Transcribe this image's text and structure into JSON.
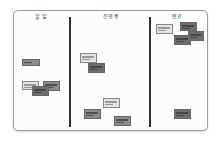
{
  "board": {
    "columns": [
      {
        "id": "todo",
        "header": "할 일"
      },
      {
        "id": "in-progress",
        "header": "진행 중"
      },
      {
        "id": "done",
        "header": "완료"
      }
    ],
    "notes": [
      {
        "column": "todo",
        "x": 8,
        "y": 48,
        "w": 18,
        "h": 7,
        "tone": "mid",
        "lines": 1
      },
      {
        "column": "todo",
        "x": 8,
        "y": 70,
        "w": 17,
        "h": 9,
        "tone": "light",
        "lines": 3
      },
      {
        "column": "todo",
        "x": 29,
        "y": 70,
        "w": 17,
        "h": 10,
        "tone": "mid",
        "lines": 3
      },
      {
        "column": "todo",
        "x": 18,
        "y": 75,
        "w": 17,
        "h": 10,
        "tone": "dark",
        "lines": 3
      },
      {
        "column": "in-progress",
        "x": 66,
        "y": 42,
        "w": 17,
        "h": 10,
        "tone": "light",
        "lines": 3
      },
      {
        "column": "in-progress",
        "x": 74,
        "y": 52,
        "w": 17,
        "h": 10,
        "tone": "dark",
        "lines": 3
      },
      {
        "column": "in-progress",
        "x": 89,
        "y": 87,
        "w": 17,
        "h": 10,
        "tone": "light",
        "lines": 3
      },
      {
        "column": "in-progress",
        "x": 70,
        "y": 98,
        "w": 17,
        "h": 10,
        "tone": "mid",
        "lines": 3
      },
      {
        "column": "in-progress",
        "x": 100,
        "y": 105,
        "w": 17,
        "h": 10,
        "tone": "mid",
        "lines": 3
      },
      {
        "column": "done",
        "x": 142,
        "y": 13,
        "w": 17,
        "h": 10,
        "tone": "light",
        "lines": 3
      },
      {
        "column": "done",
        "x": 166,
        "y": 11,
        "w": 17,
        "h": 9,
        "tone": "dark",
        "lines": 3
      },
      {
        "column": "done",
        "x": 174,
        "y": 20,
        "w": 16,
        "h": 10,
        "tone": "dark",
        "lines": 3
      },
      {
        "column": "done",
        "x": 160,
        "y": 24,
        "w": 17,
        "h": 10,
        "tone": "dark",
        "lines": 3
      },
      {
        "column": "done",
        "x": 160,
        "y": 98,
        "w": 17,
        "h": 10,
        "tone": "dark",
        "lines": 3
      }
    ]
  }
}
